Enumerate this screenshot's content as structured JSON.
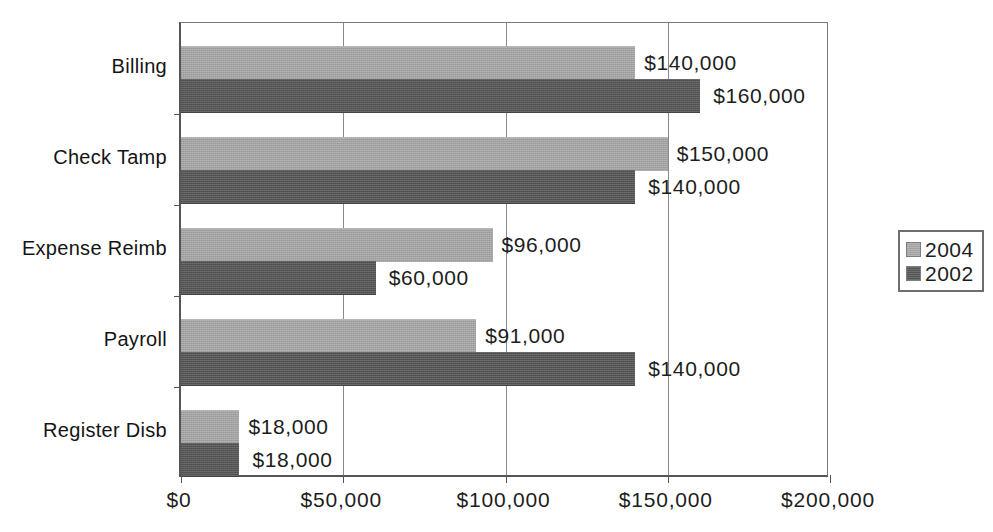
{
  "chart_data": {
    "type": "bar",
    "orientation": "horizontal",
    "title": "",
    "subtitle": "",
    "xlabel": "",
    "ylabel": "",
    "categories": [
      "Billing",
      "Check Tamp",
      "Expense Reimb",
      "Payroll",
      "Register Disb"
    ],
    "series": [
      {
        "name": "2004",
        "color": "#a3a3a3",
        "values": [
          140000,
          150000,
          96000,
          91000,
          18000
        ],
        "value_labels": [
          "$140,000",
          "$150,000",
          "$96,000",
          "$91,000",
          "$18,000"
        ]
      },
      {
        "name": "2002",
        "color": "#555555",
        "values": [
          160000,
          140000,
          60000,
          140000,
          18000
        ],
        "value_labels": [
          "$160,000",
          "$140,000",
          "$60,000",
          "$140,000",
          "$18,000"
        ]
      }
    ],
    "xlim": [
      0,
      200000
    ],
    "xticks": [
      0,
      50000,
      100000,
      150000,
      200000
    ],
    "xtick_labels": [
      "$0",
      "$50,000",
      "$100,000",
      "$150,000",
      "$200,000"
    ],
    "grid": "vertical",
    "legend_position": "right",
    "legend_entries": [
      "2004",
      "2002"
    ],
    "background_color": "#ffffff",
    "axis_color": "#555555",
    "gridline_color": "#8a8a8a"
  }
}
